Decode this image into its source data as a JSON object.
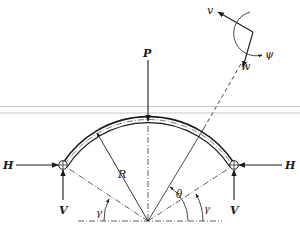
{
  "diagram": {
    "type": "circular arch free-body diagram",
    "labels": {
      "load": "P",
      "horizontal_left": "H",
      "horizontal_right": "H",
      "vertical_left": "V",
      "vertical_right": "V",
      "radius": "R",
      "angle_position": "θ",
      "angle_support_left": "γ",
      "angle_support_right": "γ",
      "disp_v": "v",
      "disp_w": "w",
      "rotation": "ψ"
    },
    "colors": {
      "ink": "#1a1a1a",
      "band": "#c8c8c8"
    }
  }
}
